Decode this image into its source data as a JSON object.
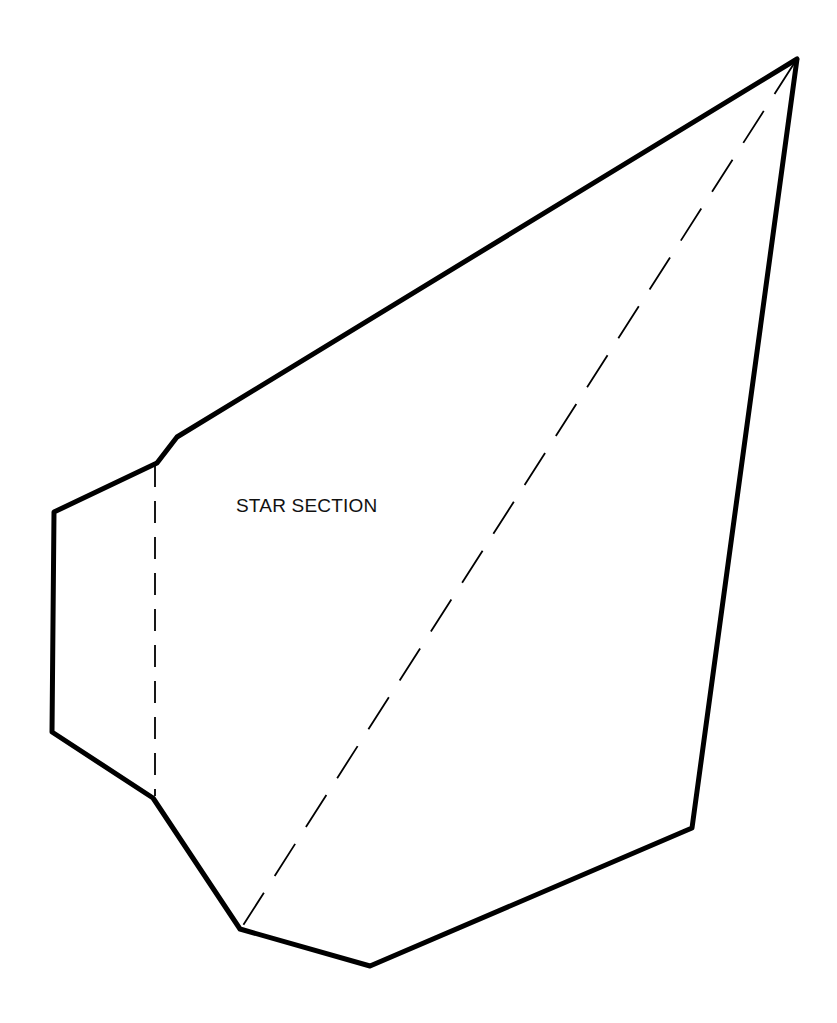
{
  "diagram": {
    "label": "STAR SECTION",
    "label_position": [
      236,
      512
    ],
    "colors": {
      "stroke": "#000000",
      "background": "#ffffff"
    },
    "outline": {
      "stroke_width": 5,
      "points": [
        [
          797,
          59
        ],
        [
          177,
          437
        ],
        [
          157,
          463
        ],
        [
          54,
          512
        ],
        [
          52,
          732
        ],
        [
          153,
          798
        ],
        [
          240,
          929
        ],
        [
          370,
          966
        ],
        [
          692,
          828
        ],
        [
          797,
          59
        ]
      ]
    },
    "fold_lines": [
      {
        "name": "vertical-fold",
        "from": [
          155,
          465
        ],
        "to": [
          155,
          796
        ],
        "dash": "22,14",
        "stroke_width": 1.8
      },
      {
        "name": "diagonal-fold",
        "from": [
          795,
          62
        ],
        "to": [
          242,
          927
        ],
        "dash": "38,20",
        "stroke_width": 1.8
      }
    ]
  }
}
